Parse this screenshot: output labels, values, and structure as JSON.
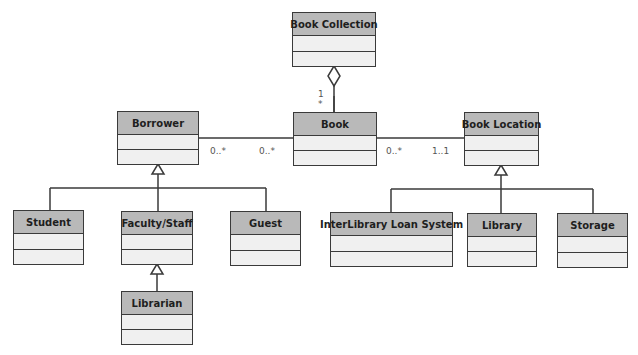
{
  "diagram": {
    "type": "UML class diagram",
    "classes": [
      {
        "id": "book_collection",
        "name": "Book Collection"
      },
      {
        "id": "book",
        "name": "Book"
      },
      {
        "id": "borrower",
        "name": "Borrower"
      },
      {
        "id": "book_location",
        "name": "Book Location"
      },
      {
        "id": "student",
        "name": "Student"
      },
      {
        "id": "faculty_staff",
        "name": "Faculty/Staff"
      },
      {
        "id": "guest",
        "name": "Guest"
      },
      {
        "id": "librarian",
        "name": "Librarian"
      },
      {
        "id": "interlibrary",
        "name": "InterLibrary Loan System"
      },
      {
        "id": "library",
        "name": "Library"
      },
      {
        "id": "storage",
        "name": "Storage"
      }
    ],
    "relationships": [
      {
        "type": "aggregation",
        "whole": "Book Collection",
        "part": "Book",
        "mult_whole": "1",
        "mult_part": "*"
      },
      {
        "type": "association",
        "from": "Borrower",
        "to": "Book",
        "mult_from": "0..*",
        "mult_to": "0..*"
      },
      {
        "type": "association",
        "from": "Book",
        "to": "Book Location",
        "mult_from": "0..*",
        "mult_to": "1..1"
      },
      {
        "type": "generalization",
        "parent": "Borrower",
        "children": [
          "Student",
          "Faculty/Staff",
          "Guest"
        ]
      },
      {
        "type": "generalization",
        "parent": "Faculty/Staff",
        "children": [
          "Librarian"
        ]
      },
      {
        "type": "generalization",
        "parent": "Book Location",
        "children": [
          "InterLibrary Loan System",
          "Library",
          "Storage"
        ]
      }
    ],
    "multiplicities": {
      "aggregation_one": "1",
      "aggregation_many": "*",
      "borrower_side": "0..*",
      "book_borrower_side": "0..*",
      "book_location_side": "0..*",
      "location_side": "1..1"
    },
    "colors": {
      "header_fill": "#b9b9b9",
      "compartment_fill": "#f0f0f0",
      "line": "#3a3a3a"
    }
  }
}
